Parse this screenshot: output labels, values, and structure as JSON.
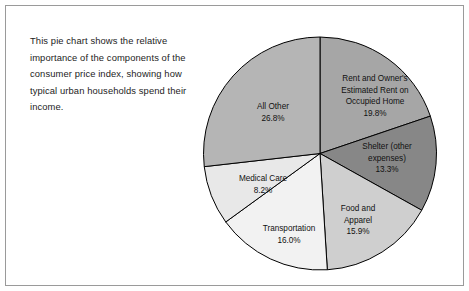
{
  "figure": {
    "caption": "This pie chart shows the relative importance of the components of the consumer price index, showing how typical urban households spend their income.",
    "border_color": "#9a9a9a",
    "background": "#ffffff"
  },
  "chart_data": {
    "type": "pie",
    "title": "",
    "subtitle": "",
    "xlabel": "",
    "ylabel": "",
    "legend_position": "none",
    "labels_inside_slices": true,
    "start_angle_deg": 0,
    "direction": "clockwise",
    "categories": [
      "Rent and Owner's Estimated Rent on Occupied Home",
      "Shelter (other expenses)",
      "Food and Apparel",
      "Transportation",
      "Medical Care",
      "All Other"
    ],
    "values": [
      19.8,
      13.3,
      15.9,
      16.0,
      8.2,
      26.8
    ],
    "value_labels": [
      "19.8%",
      "13.3%",
      "15.9%",
      "16.0%",
      "8.2%",
      "26.8%"
    ],
    "units": "percent",
    "total": 100.0,
    "colors": [
      "#a6a6a6",
      "#878787",
      "#cfcfcf",
      "#f2f2f2",
      "#e8e8e8",
      "#b5b5b5"
    ],
    "edge_color": "#000000",
    "slices": [
      {
        "name": "Rent and Owner's Estimated Rent on Occupied Home",
        "label_text": "Rent and Owner's\nEstimated Rent on\nOccupied Home",
        "value": 19.8,
        "value_label": "19.8%",
        "color": "#a6a6a6"
      },
      {
        "name": "Shelter (other expenses)",
        "label_text": "Shelter (other\nexpenses)",
        "value": 13.3,
        "value_label": "13.3%",
        "color": "#878787"
      },
      {
        "name": "Food and Apparel",
        "label_text": "Food and\nApparel",
        "value": 15.9,
        "value_label": "15.9%",
        "color": "#cfcfcf"
      },
      {
        "name": "Transportation",
        "label_text": "Transportation",
        "value": 16.0,
        "value_label": "16.0%",
        "color": "#f2f2f2"
      },
      {
        "name": "Medical Care",
        "label_text": "Medical Care",
        "value": 8.2,
        "value_label": "8.2%",
        "color": "#e8e8e8"
      },
      {
        "name": "All Other",
        "label_text": "All Other",
        "value": 26.8,
        "value_label": "26.8%",
        "color": "#b5b5b5"
      }
    ]
  }
}
